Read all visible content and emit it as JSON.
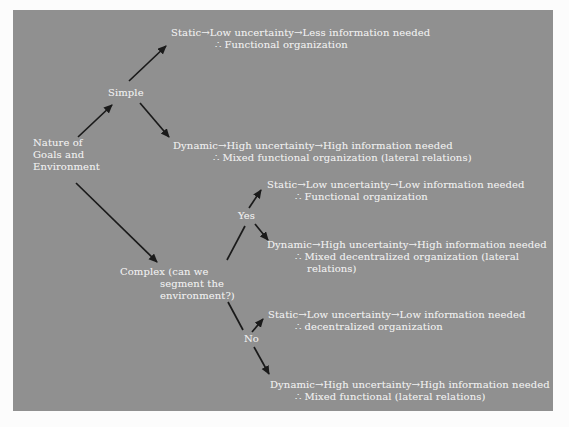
{
  "page": {
    "background": "#fcfcfc"
  },
  "panel": {
    "background": "#909090",
    "x": 13,
    "y": 10,
    "width": 540,
    "height": 401
  },
  "colors": {
    "text": "#ebebeb",
    "arrow": "#1a1a1a"
  },
  "diagram": {
    "nodes": [
      {
        "name": "node-nature-of-goals",
        "x": 33,
        "y": 137,
        "lines": [
          {
            "text": "Nature of",
            "indent": 0
          },
          {
            "text": "Goals and",
            "indent": 0
          },
          {
            "text": "Environment",
            "indent": 0
          }
        ]
      },
      {
        "name": "node-simple",
        "x": 108,
        "y": 87,
        "lines": [
          {
            "text": "Simple",
            "indent": 0
          }
        ]
      },
      {
        "name": "node-complex",
        "x": 120,
        "y": 266,
        "lines": [
          {
            "text": "Complex (can we",
            "indent": 0
          },
          {
            "text": "segment the",
            "indent": 40
          },
          {
            "text": "environment?)",
            "indent": 40
          }
        ]
      },
      {
        "name": "node-yes",
        "x": 238,
        "y": 210,
        "lines": [
          {
            "text": "Yes",
            "indent": 0
          }
        ]
      },
      {
        "name": "node-no",
        "x": 244,
        "y": 333,
        "lines": [
          {
            "text": "No",
            "indent": 0
          }
        ]
      },
      {
        "name": "outcome-simple-static",
        "x": 171,
        "y": 27,
        "lines": [
          {
            "text": "Static→Low uncertainty→Less information needed",
            "indent": 0
          },
          {
            "text": "∴ Functional organization",
            "indent": 44
          }
        ]
      },
      {
        "name": "outcome-simple-dynamic",
        "x": 173,
        "y": 140,
        "lines": [
          {
            "text": "Dynamic→High uncertainty→High information needed",
            "indent": 0
          },
          {
            "text": "∴ Mixed functional organization (lateral relations)",
            "indent": 40
          }
        ]
      },
      {
        "name": "outcome-yes-static",
        "x": 267,
        "y": 179,
        "lines": [
          {
            "text": "Static→Low uncertainty→Low information needed",
            "indent": 0
          },
          {
            "text": "∴ Functional organization",
            "indent": 28
          }
        ]
      },
      {
        "name": "outcome-yes-dynamic",
        "x": 267,
        "y": 239,
        "lines": [
          {
            "text": "Dynamic→High uncertainty→High information needed",
            "indent": 0
          },
          {
            "text": "∴ Mixed decentralized organization (lateral",
            "indent": 28
          },
          {
            "text": "relations)",
            "indent": 40
          }
        ]
      },
      {
        "name": "outcome-no-static",
        "x": 268,
        "y": 309,
        "lines": [
          {
            "text": "Static→Low uncertainty→Low information needed",
            "indent": 0
          },
          {
            "text": "∴ decentralized organization",
            "indent": 27
          }
        ]
      },
      {
        "name": "outcome-no-dynamic",
        "x": 270,
        "y": 379,
        "lines": [
          {
            "text": "Dynamic→High uncertainty→High information needed",
            "indent": 0
          },
          {
            "text": "∴ Mixed functional (lateral relations)",
            "indent": 25
          }
        ]
      }
    ],
    "arrows": [
      {
        "name": "arrow-nature-to-simple",
        "x1": 78,
        "y1": 137,
        "x2": 112,
        "y2": 105,
        "head": true
      },
      {
        "name": "arrow-simple-to-static",
        "x1": 129,
        "y1": 81,
        "x2": 166,
        "y2": 46,
        "head": true
      },
      {
        "name": "arrow-simple-to-dynamic",
        "x1": 140,
        "y1": 103,
        "x2": 169,
        "y2": 137,
        "head": true
      },
      {
        "name": "arrow-nature-to-complex",
        "x1": 76,
        "y1": 183,
        "x2": 157,
        "y2": 262,
        "head": true
      },
      {
        "name": "line-complex-to-yes",
        "x1": 227,
        "y1": 260,
        "x2": 245,
        "y2": 226,
        "head": false
      },
      {
        "name": "arrow-yes-to-static",
        "x1": 249,
        "y1": 208,
        "x2": 261,
        "y2": 190,
        "head": true
      },
      {
        "name": "arrow-yes-to-dynamic",
        "x1": 255,
        "y1": 224,
        "x2": 268,
        "y2": 240,
        "head": true
      },
      {
        "name": "line-complex-to-no",
        "x1": 228,
        "y1": 302,
        "x2": 243,
        "y2": 330,
        "head": false
      },
      {
        "name": "arrow-no-to-static",
        "x1": 252,
        "y1": 332,
        "x2": 263,
        "y2": 319,
        "head": true
      },
      {
        "name": "arrow-no-to-dynamic",
        "x1": 254,
        "y1": 347,
        "x2": 269,
        "y2": 374,
        "head": true
      }
    ]
  }
}
